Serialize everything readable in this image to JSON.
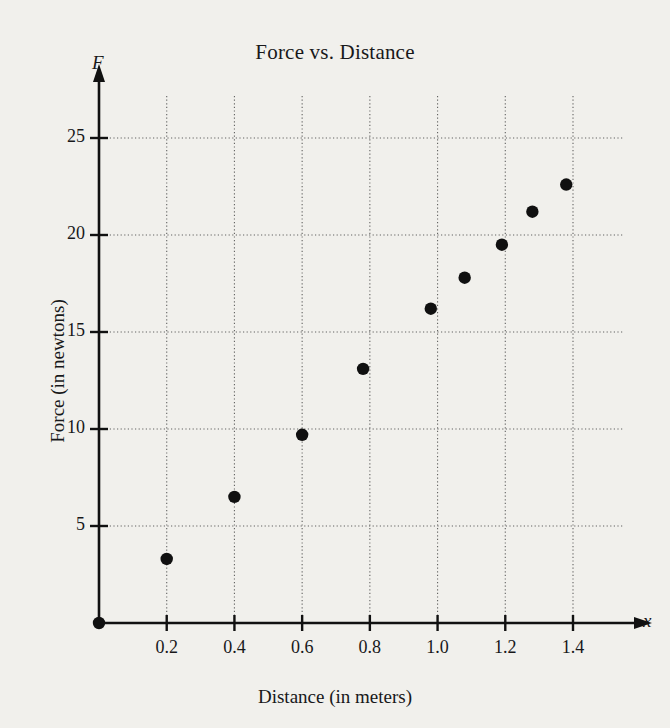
{
  "chart_data": {
    "type": "scatter",
    "title": "Force vs. Distance",
    "xlabel": "Distance (in meters)",
    "ylabel": "Force (in newtons)",
    "x_axis_symbol": "x",
    "y_axis_symbol": "F",
    "xlim": [
      0,
      1.5
    ],
    "ylim": [
      0,
      27
    ],
    "xticks": [
      0.2,
      0.4,
      0.6,
      0.8,
      1.0,
      1.2,
      1.4
    ],
    "xtick_labels": [
      "0.2",
      "0.4",
      "0.6",
      "0.8",
      "1.0",
      "1.2",
      "1.4"
    ],
    "yticks": [
      5,
      10,
      15,
      20,
      25
    ],
    "ytick_labels": [
      "5",
      "10",
      "15",
      "20",
      "25"
    ],
    "grid": true,
    "legend": null,
    "points": [
      {
        "x": 0.0,
        "y": 0.0
      },
      {
        "x": 0.2,
        "y": 3.3
      },
      {
        "x": 0.4,
        "y": 6.5
      },
      {
        "x": 0.6,
        "y": 9.7
      },
      {
        "x": 0.78,
        "y": 13.1
      },
      {
        "x": 0.98,
        "y": 16.2
      },
      {
        "x": 1.08,
        "y": 17.8
      },
      {
        "x": 1.19,
        "y": 19.5
      },
      {
        "x": 1.28,
        "y": 21.2
      },
      {
        "x": 1.38,
        "y": 22.6
      }
    ],
    "marker": "filled-circle",
    "marker_color": "#101010",
    "grid_color": "#4a4a4a",
    "axis_color": "#111111",
    "background_color": "#f1f0ec"
  }
}
